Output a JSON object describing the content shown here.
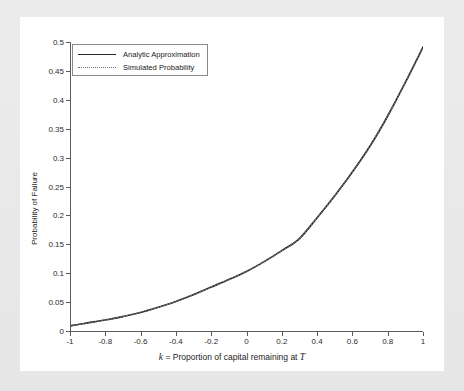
{
  "chart_data": {
    "type": "line",
    "title": "",
    "xlabel": "k = Proportion of capital remaining at T",
    "xlabel_parts": {
      "symbol": "k",
      "middle": " = Proportion of capital remaining at ",
      "symbol2": "T"
    },
    "ylabel": "Probability of Failure",
    "xlim": [
      -1,
      1
    ],
    "ylim": [
      0,
      0.5
    ],
    "grid": false,
    "legend_position": "top-left",
    "xticks": [
      -1,
      -0.8,
      -0.6,
      -0.4,
      -0.2,
      0,
      0.2,
      0.4,
      0.6,
      0.8,
      1
    ],
    "xtick_labels": [
      "-1",
      "-0.8",
      "-0.6",
      "-0.4",
      "-0.2",
      "0",
      "0.2",
      "0.4",
      "0.6",
      "0.8",
      "1"
    ],
    "yticks": [
      0,
      0.05,
      0.1,
      0.15,
      0.2,
      0.25,
      0.3,
      0.35,
      0.4,
      0.45,
      0.5
    ],
    "ytick_labels": [
      "0",
      "0.05",
      "0.1",
      "0.15",
      "0.2",
      "0.25",
      "0.3",
      "0.35",
      "0.4",
      "0.45",
      "0.5"
    ],
    "x": [
      -1,
      -0.9,
      -0.8,
      -0.7,
      -0.6,
      -0.5,
      -0.4,
      -0.3,
      -0.2,
      -0.1,
      0,
      0.1,
      0.2,
      0.3,
      0.4,
      0.5,
      0.6,
      0.7,
      0.8,
      0.9,
      1
    ],
    "series": [
      {
        "name": "Analytic Approximation",
        "style": "solid",
        "color": "#1f1f1f",
        "values": [
          0.009,
          0.014,
          0.019,
          0.025,
          0.032,
          0.041,
          0.051,
          0.063,
          0.076,
          0.089,
          0.103,
          0.12,
          0.139,
          0.16,
          0.196,
          0.234,
          0.275,
          0.32,
          0.372,
          0.43,
          0.491
        ]
      },
      {
        "name": "Simulated Probability",
        "style": "dotted",
        "color": "#6e6e6e",
        "values": [
          0.009,
          0.014,
          0.019,
          0.025,
          0.032,
          0.041,
          0.051,
          0.063,
          0.076,
          0.089,
          0.103,
          0.12,
          0.139,
          0.16,
          0.196,
          0.234,
          0.275,
          0.32,
          0.372,
          0.43,
          0.491
        ]
      }
    ]
  },
  "colors": {
    "page_background": "#e9e9e9",
    "canvas_background": "#ffffff",
    "axis": "#5b5b5b",
    "legend_border": "#8a8a8a",
    "analytic_line": "#1f1f1f",
    "simulated_line": "#6e6e6e"
  },
  "legend": {
    "entries": [
      {
        "label": "Analytic Approximation",
        "style": "solid"
      },
      {
        "label": "Simulated Probability",
        "style": "dotted"
      }
    ]
  }
}
